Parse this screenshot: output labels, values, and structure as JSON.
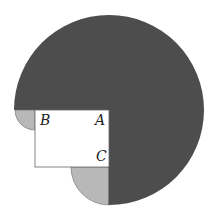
{
  "diagram": {
    "type": "geometry-figure",
    "colors": {
      "large_region": "#4d4d4d",
      "small_regions": "#b8b8b8",
      "rectangle": "#ffffff",
      "outline": "#555555"
    },
    "labels": {
      "A": "A",
      "B": "B",
      "C": "C"
    },
    "shapes": {
      "large_circle": {
        "cx": 109,
        "cy": 110,
        "r": 95,
        "description": "three-quarter circle centered at A, shaded dark"
      },
      "rectangle": {
        "x": 35,
        "y": 110,
        "width": 74,
        "height": 57,
        "corners": [
          "B",
          "A",
          "C"
        ]
      },
      "quarter_circle_B": {
        "cx": 35,
        "cy": 110,
        "r": 20,
        "description": "quarter circle centered at B, shaded light"
      },
      "quarter_circle_C": {
        "cx": 109,
        "cy": 167,
        "r": 38,
        "description": "quarter circle centered at C, shaded light"
      }
    }
  }
}
